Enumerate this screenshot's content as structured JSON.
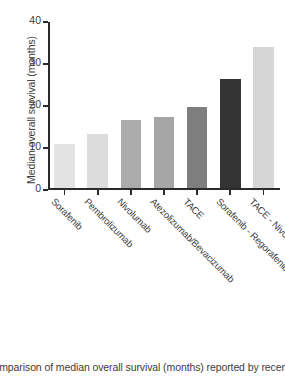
{
  "chart_data": {
    "type": "bar",
    "title": "",
    "xlabel": "",
    "ylabel": "Median overall survival (months)",
    "ylim": [
      0,
      40
    ],
    "yticks": [
      0,
      10,
      20,
      30,
      40
    ],
    "grid": false,
    "legend": "none",
    "categories": [
      "Sorafenib",
      "Pembrolizumab",
      "Nivolumab",
      "Atezolizumab/Bevacizumab",
      "TACE",
      "Sorafenib - Regorafenib (sequence)",
      "TACE - Nivolumab/Ipilimumab (sequence)"
    ],
    "values": [
      10.5,
      12.8,
      16.3,
      17.0,
      19.2,
      26.0,
      33.6
    ],
    "colors": [
      "#e3e3e3",
      "#dcdcdc",
      "#ababab",
      "#a6a6a6",
      "#7e7e7e",
      "#333333",
      "#d6d6d6"
    ]
  },
  "caption": {
    "text": "Comparison of median overall survival (months) reported by recent phase II"
  }
}
